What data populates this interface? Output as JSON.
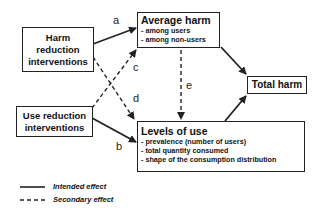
{
  "nodes": {
    "harm_reduction": {
      "label": "Harm reduction interventions",
      "lines": [
        "Harm",
        "reduction",
        "interventions"
      ]
    },
    "use_reduction": {
      "label": "Use reduction interventions",
      "lines": [
        "Use reduction",
        "interventions"
      ]
    },
    "average_harm": {
      "title": "Average harm",
      "items": [
        "- among users",
        "- among non-users"
      ]
    },
    "levels_of_use": {
      "title": "Levels of use",
      "items": [
        "- prevalence (number of users)",
        "- total quantity consumed",
        "- shape of the consumption distribution"
      ]
    },
    "total_harm": {
      "title": "Total harm"
    }
  },
  "edges": [
    {
      "label": "a",
      "from": "Harm reduction interventions",
      "to": "Average harm",
      "style": "solid"
    },
    {
      "label": "b",
      "from": "Use reduction interventions",
      "to": "Levels of use",
      "style": "solid"
    },
    {
      "label": "c",
      "from": "Use reduction interventions",
      "to": "Average harm",
      "style": "dashed"
    },
    {
      "label": "d",
      "from": "Harm reduction interventions",
      "to": "Levels of use",
      "style": "dashed"
    },
    {
      "label": "e",
      "from": "Average harm",
      "to": "Levels of use",
      "style": "dashed"
    },
    {
      "label": "",
      "from": "Average harm",
      "to": "Total harm",
      "style": "solid"
    },
    {
      "label": "",
      "from": "Levels of use",
      "to": "Total harm",
      "style": "solid"
    }
  ],
  "legend": {
    "intended": "Intended effect",
    "secondary": "Secondary effect"
  }
}
